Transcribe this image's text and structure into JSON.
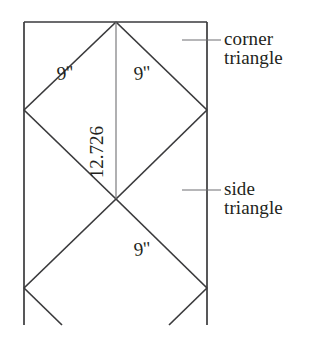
{
  "diagram": {
    "background_color": "#ffffff",
    "line_color": "#3a3a3c",
    "text_color": "#231f20",
    "callouts": [
      {
        "id": "corner-triangle",
        "line1": "corner",
        "line2": "triangle",
        "leader": {
          "x1": 182,
          "y1": 40,
          "x2": 221,
          "y2": 40
        }
      },
      {
        "id": "side-triangle",
        "line1": "side",
        "line2": "triangle",
        "leader": {
          "x1": 182,
          "y1": 190,
          "x2": 221,
          "y2": 190
        }
      }
    ],
    "measurements": [
      {
        "id": "upper-left-edge",
        "value": "9\"",
        "x": 66,
        "y": 79,
        "rotation": -6
      },
      {
        "id": "upper-right-edge",
        "value": "9\"",
        "x": 143,
        "y": 79,
        "rotation": -6
      },
      {
        "id": "center-height",
        "value": "12.726",
        "x": 103,
        "y": 152,
        "rotation": -90
      },
      {
        "id": "lower-right-edge",
        "value": "9\"",
        "x": 143,
        "y": 255,
        "rotation": -6
      }
    ],
    "geometry": {
      "rect": {
        "left": 24,
        "top": 22,
        "right": 207,
        "bottom_visible": 325
      },
      "top_apex": {
        "x": 116,
        "y": 22
      },
      "left_vertex": {
        "x": 24,
        "y": 110
      },
      "right_vertex": {
        "x": 207,
        "y": 110
      },
      "center_cross": {
        "x": 116,
        "y": 199
      },
      "lower_left_vertex": {
        "x": 24,
        "y": 288
      },
      "lower_right_vertex": {
        "x": 207,
        "y": 288
      },
      "dimension_line": {
        "x": 116,
        "y1": 22,
        "y2": 199
      }
    }
  }
}
